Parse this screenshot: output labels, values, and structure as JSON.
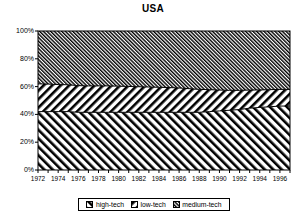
{
  "chart_data": {
    "type": "area",
    "title": "USA",
    "stacked": true,
    "normalized_percent": true,
    "xlabel": "",
    "ylabel": "",
    "xlim": [
      1972,
      1997
    ],
    "ylim": [
      0,
      100
    ],
    "grid": false,
    "legend_position": "bottom",
    "x": [
      1972,
      1973,
      1974,
      1975,
      1976,
      1977,
      1978,
      1979,
      1980,
      1981,
      1982,
      1983,
      1984,
      1985,
      1986,
      1987,
      1988,
      1989,
      1990,
      1991,
      1992,
      1993,
      1994,
      1995,
      1996,
      1997
    ],
    "x_tick_labels": [
      "1972",
      "1974",
      "1976",
      "1978",
      "1980",
      "1982",
      "1984",
      "1986",
      "1988",
      "1990",
      "1992",
      "1994",
      "1996"
    ],
    "y_tick_labels": [
      "0%",
      "20%",
      "40%",
      "60%",
      "80%",
      "100%"
    ],
    "y_ticks": [
      0,
      20,
      40,
      60,
      80,
      100
    ],
    "series": [
      {
        "name": "high-tech",
        "pattern": "diagonal-stripe-up",
        "values": [
          42,
          42,
          42,
          42,
          41.5,
          41.5,
          41.5,
          41.5,
          41.5,
          41.5,
          41.5,
          41.5,
          41.5,
          41.5,
          41.5,
          41.5,
          41.5,
          42,
          42.5,
          43,
          43.5,
          44.5,
          45,
          45.5,
          46,
          46
        ]
      },
      {
        "name": "low-tech",
        "pattern": "diagonal-stripe-down",
        "values": [
          20,
          19.8,
          19.5,
          19.3,
          19.2,
          19,
          19,
          19,
          18.8,
          18.6,
          18.4,
          18.2,
          18,
          17.8,
          17.5,
          17,
          16.5,
          15.8,
          15,
          14.3,
          13.8,
          13,
          12.6,
          12.3,
          12,
          12
        ]
      },
      {
        "name": "medium-tech",
        "pattern": "diagonal-hatch-dense",
        "values": [
          38,
          38.2,
          38.5,
          38.7,
          39.3,
          39.5,
          39.5,
          39.5,
          39.7,
          39.9,
          40.1,
          40.3,
          40.5,
          40.7,
          41,
          41.5,
          42,
          42.2,
          42.5,
          42.7,
          42.7,
          42.5,
          42.4,
          42.2,
          42,
          42
        ]
      }
    ],
    "legend": [
      {
        "label": "high-tech",
        "pattern": "diagonal-stripe-up"
      },
      {
        "label": "low-tech",
        "pattern": "diagonal-stripe-down"
      },
      {
        "label": "medium-tech",
        "pattern": "diagonal-hatch-dense"
      }
    ]
  }
}
